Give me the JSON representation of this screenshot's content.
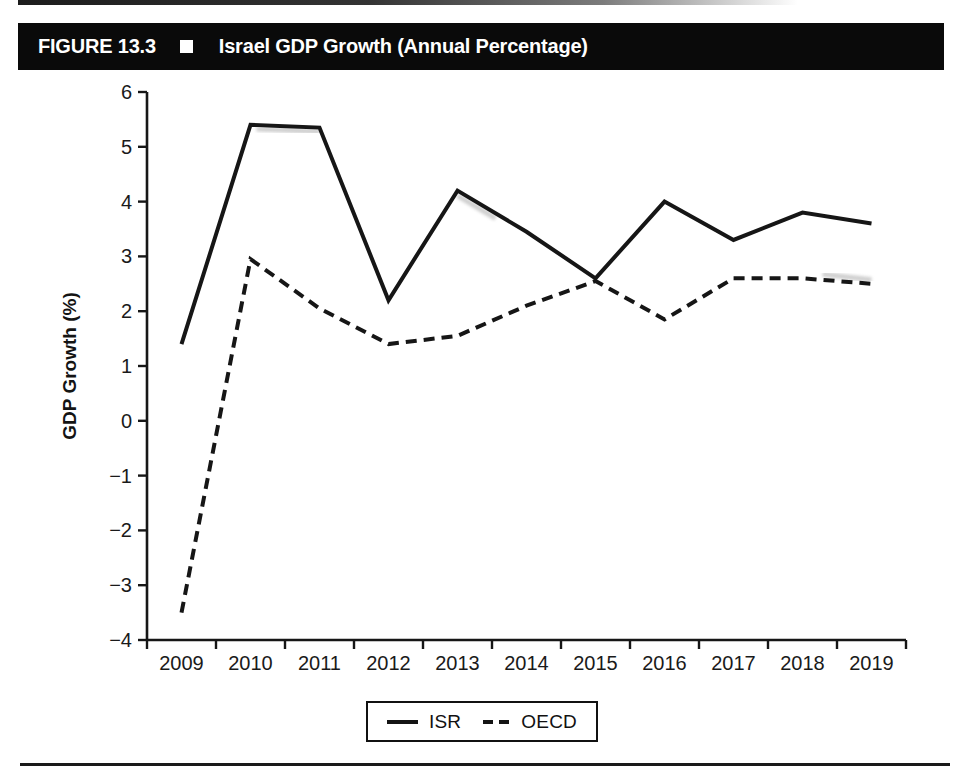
{
  "header": {
    "figure_label": "FIGURE 13.3",
    "separator_icon": "white-square-bullet",
    "title": "Israel GDP Growth (Annual Percentage)"
  },
  "chart_data": {
    "type": "line",
    "title": "Israel GDP Growth (Annual Percentage)",
    "xlabel": "",
    "ylabel": "GDP Growth (%)",
    "x": [
      2009,
      2010,
      2011,
      2012,
      2013,
      2014,
      2015,
      2016,
      2017,
      2018,
      2019
    ],
    "series": [
      {
        "name": "ISR",
        "line_style": "solid",
        "color": "#161616",
        "values": [
          1.4,
          5.4,
          5.35,
          2.2,
          4.2,
          3.45,
          2.6,
          4.0,
          3.3,
          3.8,
          3.6
        ]
      },
      {
        "name": "OECD",
        "line_style": "dashed",
        "color": "#161616",
        "values": [
          -3.5,
          2.95,
          2.05,
          1.4,
          1.55,
          2.1,
          2.55,
          1.85,
          2.6,
          2.6,
          2.5
        ]
      }
    ],
    "ylim": [
      -4,
      6
    ],
    "yticks": [
      -4,
      -3,
      -2,
      -1,
      0,
      1,
      2,
      3,
      4,
      5,
      6
    ],
    "grid": false,
    "legend_position": "bottom-center"
  },
  "legend": {
    "items": [
      {
        "label": "ISR",
        "sample": "solid-line"
      },
      {
        "label": "OECD",
        "sample": "dashed-line"
      }
    ]
  },
  "colors": {
    "ink": "#161616",
    "header_bar": "#0a0a0a",
    "header_text": "#ffffff",
    "background": "#ffffff"
  }
}
